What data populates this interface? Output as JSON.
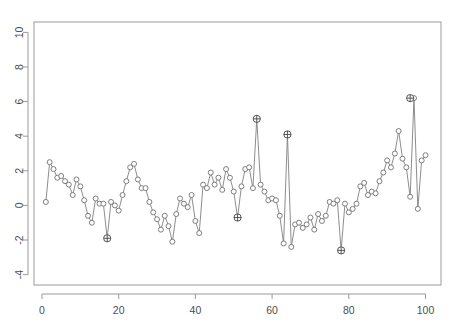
{
  "chart_data": {
    "type": "line",
    "title": "",
    "subtitle": "",
    "xlabel": "",
    "ylabel": "",
    "xlim": [
      0,
      103
    ],
    "ylim": [
      -4.6,
      10.6
    ],
    "xticks": [
      0,
      20,
      40,
      60,
      80,
      100
    ],
    "yticks": [
      -4,
      -2,
      0,
      2,
      4,
      6,
      8,
      10
    ],
    "xtick_labels": [
      "0",
      "20",
      "40",
      "60",
      "80",
      "100"
    ],
    "ytick_labels": [
      "-4",
      "-2",
      "0",
      "2",
      "4",
      "6",
      "8",
      "10"
    ],
    "grid": false,
    "legend": null,
    "marker": "open-circle",
    "line_color": "#808080",
    "marker_color": "#707070",
    "outlier_marker": "crossed-circle",
    "outlier_color": "#555555",
    "series": [
      {
        "name": "observed",
        "x": [
          1,
          2,
          3,
          4,
          5,
          6,
          7,
          8,
          9,
          10,
          11,
          12,
          13,
          14,
          15,
          16,
          17,
          18,
          19,
          20,
          21,
          22,
          23,
          24,
          25,
          26,
          27,
          28,
          29,
          30,
          31,
          32,
          33,
          34,
          35,
          36,
          37,
          38,
          39,
          40,
          41,
          42,
          43,
          44,
          45,
          46,
          47,
          48,
          49,
          50,
          51,
          52,
          53,
          54,
          55,
          56,
          57,
          58,
          59,
          60,
          61,
          62,
          63,
          64,
          65,
          66,
          67,
          68,
          69,
          70,
          71,
          72,
          73,
          74,
          75,
          76,
          77,
          78,
          79,
          80,
          81,
          82,
          83,
          84,
          85,
          86,
          87,
          88,
          89,
          90,
          91,
          92,
          93,
          94,
          95,
          96,
          97,
          98,
          99,
          100
        ],
        "values": [
          0.2,
          2.5,
          2.1,
          1.6,
          1.7,
          1.4,
          1.2,
          0.6,
          1.5,
          1.1,
          0.3,
          -0.6,
          -1.0,
          0.4,
          0.1,
          0.1,
          -1.9,
          0.2,
          0.0,
          -0.3,
          0.6,
          1.4,
          2.2,
          2.4,
          1.5,
          1.0,
          1.0,
          0.2,
          -0.4,
          -0.8,
          -1.4,
          -0.6,
          -1.2,
          -2.1,
          -0.5,
          0.4,
          0.1,
          -0.1,
          0.6,
          -0.9,
          -1.6,
          1.2,
          1.0,
          1.9,
          1.2,
          1.6,
          0.9,
          2.1,
          1.6,
          0.8,
          -0.7,
          1.1,
          2.1,
          2.2,
          1.0,
          5.0,
          1.2,
          0.8,
          0.3,
          0.4,
          0.3,
          -0.6,
          -2.2,
          4.1,
          -2.4,
          -1.1,
          -1.0,
          -1.3,
          -1.1,
          -0.7,
          -1.4,
          -0.5,
          -0.9,
          -0.6,
          0.2,
          0.1,
          0.3,
          -2.6,
          0.1,
          -0.4,
          -0.2,
          0.1,
          1.1,
          1.3,
          0.6,
          0.8,
          0.7,
          1.4,
          1.9,
          2.6,
          2.2,
          3.0,
          4.3,
          2.7,
          2.2,
          0.5,
          6.2,
          -0.2,
          2.6,
          2.9
        ]
      }
    ],
    "outliers": [
      {
        "x": 17,
        "y": -1.9
      },
      {
        "x": 51,
        "y": -0.7
      },
      {
        "x": 56,
        "y": 5.0
      },
      {
        "x": 64,
        "y": 4.1
      },
      {
        "x": 78,
        "y": -2.6
      },
      {
        "x": 96,
        "y": 6.2
      }
    ],
    "plot_box": {
      "left": 42,
      "right": 437,
      "top": 22,
      "bottom": 285
    }
  },
  "axes": {
    "y_axis_name": "y-axis",
    "x_axis_name": "x-axis"
  }
}
